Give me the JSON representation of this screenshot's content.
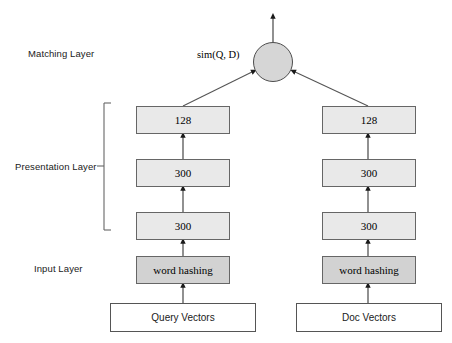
{
  "diagram": {
    "labels": {
      "matching_layer": "Matching Layer",
      "presentation_layer": "Presentation Layer",
      "input_layer": "Input Layer"
    },
    "matching": {
      "sim_label": "sim(Q, D)",
      "node_name": "similarity-node"
    },
    "columns": [
      {
        "side": "query",
        "boxes": [
          {
            "label": "128",
            "style": "light"
          },
          {
            "label": "300",
            "style": "light"
          },
          {
            "label": "300",
            "style": "light"
          },
          {
            "label": "word hashing",
            "style": "dark"
          }
        ],
        "input": "Query Vectors"
      },
      {
        "side": "doc",
        "boxes": [
          {
            "label": "128",
            "style": "light"
          },
          {
            "label": "300",
            "style": "light"
          },
          {
            "label": "300",
            "style": "light"
          },
          {
            "label": "word hashing",
            "style": "dark"
          }
        ],
        "input": "Doc Vectors"
      }
    ],
    "colors": {
      "box_fill_light": "#e9e9e9",
      "box_fill_dark": "#d2d2d2",
      "box_border": "#666666",
      "circle_fill": "#d6d6d6",
      "line": "#555555",
      "text": "#000000"
    }
  }
}
